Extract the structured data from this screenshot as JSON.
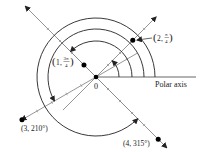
{
  "diagram": {
    "pole_label": "0",
    "polar_axis_label": "Polar axis",
    "points": [
      {
        "id": "p1",
        "r": 2,
        "theta_deg": 45,
        "label_r": "2",
        "label_theta_num": "π",
        "label_theta_den": "4",
        "label_style": "fraction"
      },
      {
        "id": "p2",
        "r": 1,
        "theta_deg": 135,
        "label_r": "1",
        "label_theta_num": "3π",
        "label_theta_den": "4",
        "label_style": "fraction"
      },
      {
        "id": "p3",
        "r": 3,
        "theta_deg": 210,
        "label": "(3, 210°)",
        "label_style": "plain"
      },
      {
        "id": "p4",
        "r": 4,
        "theta_deg": 315,
        "label": "(4, 315°)",
        "label_style": "plain"
      }
    ],
    "rays_deg": [
      45,
      135,
      210,
      315
    ],
    "angle_arcs_deg": [
      45,
      135,
      210,
      315
    ],
    "colors": {
      "axis": "#8a8a8a",
      "arc": "#222222",
      "point": "#000000",
      "text": "#222222"
    }
  }
}
